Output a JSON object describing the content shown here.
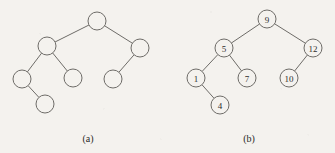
{
  "figure": {
    "background_color": "#f4f2ee",
    "stroke_color": "#6e6c68",
    "text_color": "#2b2a28",
    "width": 335,
    "height": 153
  },
  "panels": [
    {
      "id": "panel-a",
      "caption": "(a)",
      "caption_x": 88,
      "caption_y": 142,
      "description": "binary tree with unlabeled nodes",
      "node_radius": 9,
      "labeled": false,
      "nodes": [
        {
          "id": "a-root",
          "label": "",
          "x": 97,
          "y": 21
        },
        {
          "id": "a-n2",
          "label": "",
          "x": 47,
          "y": 46
        },
        {
          "id": "a-n3",
          "label": "",
          "x": 140,
          "y": 48
        },
        {
          "id": "a-n4",
          "label": "",
          "x": 22,
          "y": 79
        },
        {
          "id": "a-n5",
          "label": "",
          "x": 73,
          "y": 78
        },
        {
          "id": "a-n6",
          "label": "",
          "x": 113,
          "y": 79
        },
        {
          "id": "a-n7",
          "label": "",
          "x": 45,
          "y": 104
        }
      ],
      "edges": [
        {
          "from": "a-root",
          "to": "a-n2"
        },
        {
          "from": "a-root",
          "to": "a-n3"
        },
        {
          "from": "a-n2",
          "to": "a-n4"
        },
        {
          "from": "a-n2",
          "to": "a-n5"
        },
        {
          "from": "a-n3",
          "to": "a-n6"
        },
        {
          "from": "a-n4",
          "to": "a-n7"
        }
      ]
    },
    {
      "id": "panel-b",
      "caption": "(b)",
      "caption_x": 249,
      "caption_y": 142,
      "description": "binary search tree with labeled nodes",
      "node_radius": 9,
      "labeled": true,
      "nodes": [
        {
          "id": "b-9",
          "label": "9",
          "x": 267,
          "y": 19
        },
        {
          "id": "b-5",
          "label": "5",
          "x": 224,
          "y": 48
        },
        {
          "id": "b-12",
          "label": "12",
          "x": 313,
          "y": 48
        },
        {
          "id": "b-1",
          "label": "1",
          "x": 196,
          "y": 78
        },
        {
          "id": "b-7",
          "label": "7",
          "x": 247,
          "y": 78
        },
        {
          "id": "b-10",
          "label": "10",
          "x": 289,
          "y": 78
        },
        {
          "id": "b-4",
          "label": "4",
          "x": 220,
          "y": 105
        }
      ],
      "edges": [
        {
          "from": "b-9",
          "to": "b-5"
        },
        {
          "from": "b-9",
          "to": "b-12"
        },
        {
          "from": "b-5",
          "to": "b-1"
        },
        {
          "from": "b-5",
          "to": "b-7"
        },
        {
          "from": "b-12",
          "to": "b-10"
        },
        {
          "from": "b-1",
          "to": "b-4"
        }
      ]
    }
  ]
}
